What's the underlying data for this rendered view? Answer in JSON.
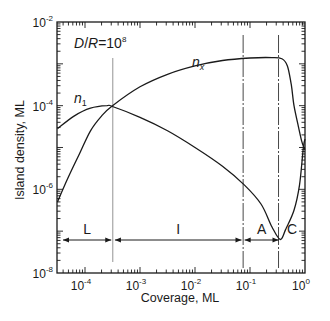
{
  "chart_data": {
    "type": "line",
    "title": "",
    "annotation": {
      "text": "D/R=10",
      "superscript": "8"
    },
    "xlabel": "Coverage, ML",
    "ylabel": "Island density, ML",
    "xscale": "log",
    "yscale": "log",
    "xlim": [
      3e-05,
      1
    ],
    "ylim": [
      1e-08,
      0.01
    ],
    "x_ticks": [
      {
        "base": "10",
        "exp": "-4",
        "value": 0.0001
      },
      {
        "base": "10",
        "exp": "-3",
        "value": 0.001
      },
      {
        "base": "10",
        "exp": "-2",
        "value": 0.01
      },
      {
        "base": "10",
        "exp": "-1",
        "value": 0.1
      },
      {
        "base": "10",
        "exp": "0",
        "value": 1
      }
    ],
    "y_ticks": [
      {
        "base": "10",
        "exp": "-2",
        "value": 0.01
      },
      {
        "base": "10",
        "exp": "-4",
        "value": 0.0001
      },
      {
        "base": "10",
        "exp": "-6",
        "value": 1e-06
      },
      {
        "base": "10",
        "exp": "-8",
        "value": 1e-08
      }
    ],
    "series": [
      {
        "name": "n1",
        "label_main": "n",
        "label_sub": "1",
        "log_x": [
          -4.5,
          -4.2,
          -3.9,
          -3.6,
          -3.5,
          -3.0,
          -2.5,
          -2.0,
          -1.5,
          -1.1,
          -0.8,
          -0.6,
          -0.45,
          -0.35,
          -0.2,
          -0.1,
          -0.03,
          0
        ],
        "log_y": [
          -4.55,
          -4.25,
          -4.06,
          -4.0,
          -4.02,
          -4.28,
          -4.6,
          -5.0,
          -5.45,
          -5.9,
          -6.35,
          -6.9,
          -7.2,
          -6.95,
          -6.5,
          -5.9,
          -5.0,
          -4.8
        ]
      },
      {
        "name": "nx",
        "label_main": "n",
        "label_sub": "x",
        "log_x": [
          -4.5,
          -4.3,
          -4.1,
          -3.9,
          -3.7,
          -3.5,
          -3.0,
          -2.5,
          -2.0,
          -1.5,
          -1.0,
          -0.6,
          -0.42,
          -0.32,
          -0.25,
          -0.2,
          -0.12,
          -0.06,
          -0.02,
          0
        ],
        "log_y": [
          -6.3,
          -5.7,
          -5.15,
          -4.6,
          -4.25,
          -4.0,
          -3.55,
          -3.25,
          -3.05,
          -2.92,
          -2.86,
          -2.85,
          -2.88,
          -3.05,
          -3.5,
          -4.0,
          -4.5,
          -4.85,
          -5.0,
          -5.05
        ]
      }
    ],
    "regions": [
      {
        "label": "L",
        "from": 3.5e-05,
        "to": 0.0003
      },
      {
        "label": "I",
        "from": 0.00035,
        "to": 0.07
      },
      {
        "label": "A",
        "from": 0.08,
        "to": 0.33
      },
      {
        "label": "C",
        "from": 0.35,
        "to": 1
      }
    ],
    "vertical_lines": [
      0.00032,
      0.075,
      0.33
    ],
    "grid": false,
    "legend": "none (inline curve labels)"
  }
}
